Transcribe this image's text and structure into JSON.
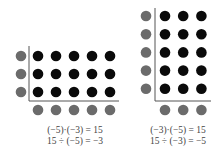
{
  "colors": {
    "black_dot": "#0a0a0a",
    "gray_dot": "#6b6b6b",
    "axis": "#555555",
    "text": "#444444"
  },
  "left_diagram": {
    "rows": 3,
    "cols": 5,
    "equations": [
      "(−5)·(−3) = 15",
      "15 ÷ (−5) = −3"
    ]
  },
  "right_diagram": {
    "rows": 5,
    "cols": 3,
    "equations": [
      "(−3)·(−5) = 15",
      "15 ÷ (−3) = −5"
    ]
  }
}
